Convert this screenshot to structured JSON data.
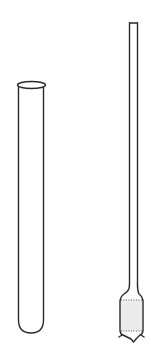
{
  "diagram": {
    "background_color": "#ffffff",
    "stroke_color": "#2a2a2a",
    "objects": [
      {
        "name": "test-tube",
        "kind": "test tube",
        "features": [
          "flared lip",
          "straight walls",
          "rounded bottom"
        ]
      },
      {
        "name": "filter-tube",
        "kind": "narrow tube with bulb",
        "features": [
          "long narrow stem",
          "open square top",
          "widened bulb",
          "stippled filling",
          "dotted fill boundaries",
          "pointed base"
        ]
      }
    ]
  }
}
